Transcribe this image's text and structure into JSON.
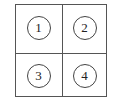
{
  "diagram": {
    "type": "2x2 grid",
    "cells": [
      {
        "label": "1",
        "row": 1,
        "col": 1
      },
      {
        "label": "2",
        "row": 1,
        "col": 2
      },
      {
        "label": "3",
        "row": 2,
        "col": 1
      },
      {
        "label": "4",
        "row": 2,
        "col": 2
      }
    ]
  }
}
